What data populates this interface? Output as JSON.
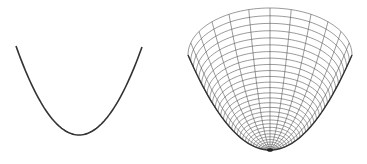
{
  "figure": {
    "width": 367,
    "height": 164,
    "background": "#ffffff",
    "panels": [
      {
        "id": "parabola-2d",
        "description": "2D parabola curve y = x^2",
        "stroke": "#333333",
        "stroke_width": 1.6,
        "left_end": [
          16,
          46
        ],
        "vertex": [
          79,
          135
        ],
        "right_end": [
          142,
          47
        ]
      },
      {
        "id": "paraboloid-3d",
        "description": "3D wireframe paraboloid z = x^2 + y^2 viewed from above",
        "stroke": "#555555",
        "edge_stroke": "#333333",
        "stroke_width": 0.6,
        "bottom": [
          270,
          150
        ],
        "rim_center_y": 55,
        "rim_half_width": 82,
        "rim_back_offset": 47,
        "rings": 30,
        "meridians": 24
      }
    ]
  }
}
